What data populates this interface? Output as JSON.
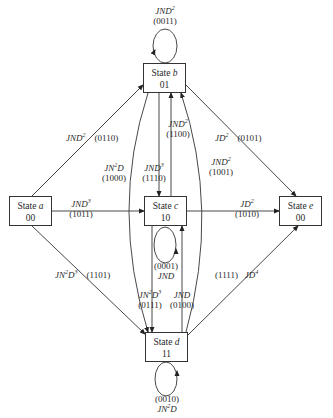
{
  "states": [
    {
      "id": "a",
      "prefix": "State",
      "letter": "a",
      "code": "00"
    },
    {
      "id": "b",
      "prefix": "State",
      "letter": "b",
      "code": "01"
    },
    {
      "id": "c",
      "prefix": "State",
      "letter": "c",
      "code": "10"
    },
    {
      "id": "d",
      "prefix": "State",
      "letter": "d",
      "code": "11"
    },
    {
      "id": "e",
      "prefix": "State",
      "letter": "e",
      "code": "00"
    }
  ],
  "edges": [
    {
      "from": "b",
      "to": "b",
      "gain": "JND2",
      "gain_base": "JND",
      "gain_exp": "2",
      "path": "(0011)"
    },
    {
      "from": "a",
      "to": "b",
      "gain": "JND2",
      "gain_base": "JND",
      "gain_exp": "2",
      "path": "(0110)"
    },
    {
      "from": "a",
      "to": "c",
      "gain": "JND3",
      "gain_base": "JND",
      "gain_exp": "3",
      "path": "(1011)"
    },
    {
      "from": "a",
      "to": "d",
      "gain": "JN2D3",
      "gain_base": "JN",
      "gain_mid": "2",
      "gain_tail": "D",
      "gain_exp": "3",
      "path": "(1101)"
    },
    {
      "from": "b",
      "to": "d",
      "gain": "JN2D",
      "gain_base": "JN",
      "gain_mid": "2",
      "gain_tail": "D",
      "path": "(1000)"
    },
    {
      "from": "b",
      "to": "c",
      "gain": "JND3",
      "gain_base": "JND",
      "gain_exp": "3",
      "path": "(1110)"
    },
    {
      "from": "c",
      "to": "b",
      "gain": "JND2",
      "gain_base": "JND",
      "gain_exp": "2",
      "path": "(1100)"
    },
    {
      "from": "d",
      "to": "b",
      "gain": "JND2",
      "gain_base": "JND",
      "gain_exp": "2",
      "path": "(1001)"
    },
    {
      "from": "b",
      "to": "e",
      "gain": "JD2",
      "gain_base": "JD",
      "gain_exp": "2",
      "path": "(0101)"
    },
    {
      "from": "c",
      "to": "e",
      "gain": "JD2",
      "gain_base": "JD",
      "gain_exp": "2",
      "path": "(1010)"
    },
    {
      "from": "c",
      "to": "c",
      "gain": "JND",
      "gain_base": "JND",
      "path": "(0001)"
    },
    {
      "from": "c",
      "to": "d",
      "gain": "JN2D3",
      "gain_base": "JN",
      "gain_mid": "2",
      "gain_tail": "D",
      "gain_exp": "3",
      "path": "(0111)"
    },
    {
      "from": "d",
      "to": "c",
      "gain": "JND",
      "gain_base": "JND",
      "path": "(0100)"
    },
    {
      "from": "d",
      "to": "e",
      "gain": "JD4",
      "gain_base": "JD",
      "gain_exp": "4",
      "path": "(1111)"
    },
    {
      "from": "d",
      "to": "d",
      "gain": "JN2D",
      "gain_base": "JN",
      "gain_mid": "2",
      "gain_tail": "D",
      "path": "(0010)"
    }
  ]
}
